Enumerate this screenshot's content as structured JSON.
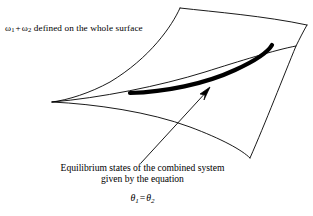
{
  "figure": {
    "type": "line-diagram",
    "width": 313,
    "height": 216,
    "background_color": "#ffffff",
    "stroke_color": "#000000",
    "annotations": {
      "top_label": {
        "omega1": "ω",
        "omega1_sub": "1",
        "plus": "+",
        "omega2": "ω",
        "omega2_sub": "2",
        "text": " defined on the whole surface",
        "full_text": "ω₁ + ω₂ defined on the whole surface"
      },
      "caption": {
        "line1": "Equilibrium states of the combined system",
        "line2": "given by the equation"
      },
      "equation": {
        "theta1": "θ",
        "theta1_sub": "1",
        "equals": "=",
        "theta2": "θ",
        "theta2_sub": "2",
        "full_text": "θ₁ = θ₂"
      }
    },
    "elements": {
      "surface_name": "thermodynamic-configuration-surface",
      "curve_name": "equilibrium-states-curve",
      "arrow_name": "caption-pointer-arrow"
    }
  }
}
